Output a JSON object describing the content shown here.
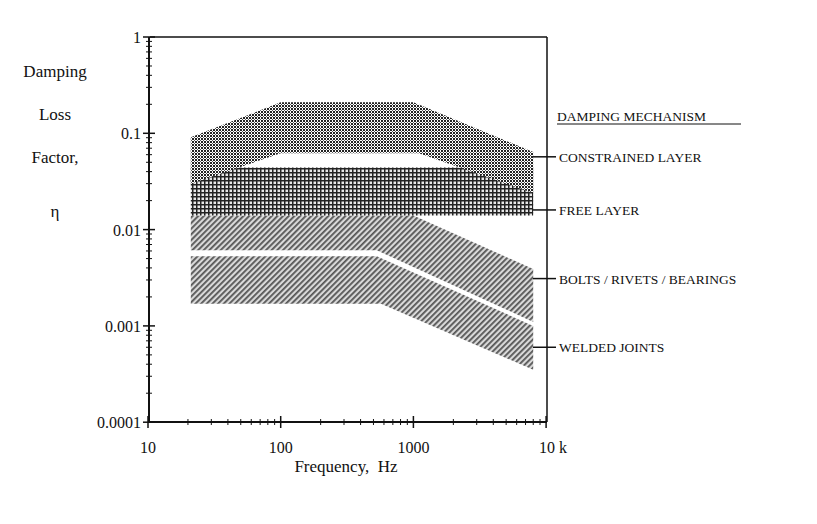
{
  "chart_data": {
    "type": "area",
    "title": "",
    "xlabel": "Frequency,  Hz",
    "ylabel": [
      "Damping",
      "Loss",
      "Factor,",
      "η"
    ],
    "xscale": "log",
    "yscale": "log",
    "xlim": [
      10,
      10000
    ],
    "ylim": [
      0.0001,
      1
    ],
    "x_tick_labels": [
      "10",
      "100",
      "1000",
      "10 k"
    ],
    "x_tick_values": [
      10,
      100,
      1000,
      10000
    ],
    "y_tick_labels": [
      "1",
      "0.1",
      "0.01",
      "0.001",
      "0.0001"
    ],
    "y_tick_values": [
      1,
      0.1,
      0.01,
      0.001,
      0.0001
    ],
    "grid": false,
    "legend_title": "DAMPING MECHANISM",
    "legend_position": "right",
    "series": [
      {
        "name": "CONSTRAINED LAYER",
        "pattern": "dense-dark-checker",
        "upper": {
          "x": [
            21,
            100,
            1000,
            8000
          ],
          "y": [
            0.091,
            0.21,
            0.21,
            0.064
          ]
        },
        "lower": {
          "x": [
            21,
            100,
            1100,
            8000
          ],
          "y": [
            0.03,
            0.062,
            0.062,
            0.024
          ]
        },
        "legend_marker_y": 0.057
      },
      {
        "name": "FREE LAYER",
        "pattern": "crosshatch-grid",
        "upper": {
          "x": [
            21,
            8000
          ],
          "y": [
            0.044,
            0.044
          ]
        },
        "lower": {
          "x": [
            21,
            8000
          ],
          "y": [
            0.014,
            0.014
          ]
        },
        "legend_marker_y": 0.016
      },
      {
        "name": "BOLTS / RIVETS / BEARINGS",
        "pattern": "diagonal-hatch",
        "upper": {
          "x": [
            21,
            1000,
            8000
          ],
          "y": [
            0.014,
            0.014,
            0.0039
          ]
        },
        "lower": {
          "x": [
            21,
            530,
            8000
          ],
          "y": [
            0.0061,
            0.0061,
            0.0011
          ]
        },
        "legend_marker_y": 0.0031
      },
      {
        "name": "WELDED JOINTS",
        "pattern": "diagonal-hatch",
        "upper": {
          "x": [
            21,
            530,
            8000
          ],
          "y": [
            0.0053,
            0.0053,
            0.001
          ]
        },
        "lower": {
          "x": [
            21,
            570,
            8000
          ],
          "y": [
            0.0017,
            0.0017,
            0.00035
          ]
        },
        "legend_marker_y": 0.0006
      }
    ]
  },
  "colors": {
    "axis": "#111111",
    "constrained_fill": "#3a3a3a",
    "free_fill": "#555555",
    "hatch_fill": "#6a6a6a",
    "background": "#ffffff"
  }
}
